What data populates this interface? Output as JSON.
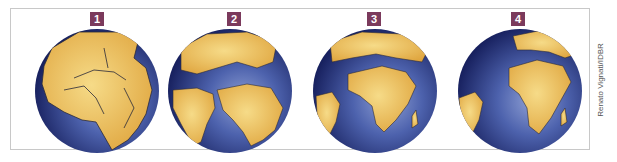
{
  "figure": {
    "panels": [
      {
        "label": "1",
        "stage": "pangaea"
      },
      {
        "label": "2",
        "stage": "early-breakup"
      },
      {
        "label": "3",
        "stage": "atlantic-opening"
      },
      {
        "label": "4",
        "stage": "present-day"
      }
    ],
    "credit": "Renato Vignati/IDBR"
  },
  "colors": {
    "ocean_dark": "#1d2a6e",
    "ocean_light": "#6a7fc0",
    "land": "#e8b448",
    "land_light": "#f3d27a",
    "badge": "#7b3a5c"
  }
}
